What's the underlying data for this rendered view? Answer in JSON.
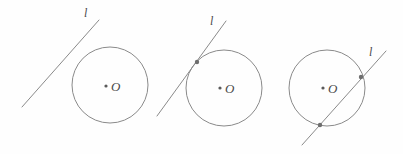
{
  "figure": {
    "width": 403,
    "height": 154,
    "background_color": "#fefefe",
    "stroke_color": "#8a8a8a",
    "dot_color": "#6e6e6e",
    "label_color": "#4a4a4a"
  },
  "panels": [
    {
      "id": "panel-separate",
      "relationship": "separate",
      "line_label": "l",
      "center_label": "O",
      "circle": {
        "cx": 110,
        "cy": 85,
        "r": 38
      },
      "line": {
        "x1": 22,
        "y1": 107,
        "x2": 99,
        "y2": 20
      },
      "line_label_pos": {
        "x": 84,
        "y": 17
      },
      "center_dot": {
        "x": 106,
        "y": 86
      },
      "center_label_pos": {
        "x": 111,
        "y": 91
      },
      "intersections": []
    },
    {
      "id": "panel-tangent",
      "relationship": "tangent",
      "line_label": "l",
      "center_label": "O",
      "circle": {
        "cx": 224,
        "cy": 88,
        "r": 38
      },
      "line": {
        "x1": 157,
        "y1": 116,
        "x2": 226,
        "y2": 21
      },
      "line_label_pos": {
        "x": 210,
        "y": 25
      },
      "center_dot": {
        "x": 220,
        "y": 88
      },
      "center_label_pos": {
        "x": 225,
        "y": 93
      },
      "intersections": [
        {
          "x": 197,
          "y": 62
        }
      ]
    },
    {
      "id": "panel-secant",
      "relationship": "secant",
      "line_label": "l",
      "center_label": "O",
      "circle": {
        "cx": 327,
        "cy": 88,
        "r": 38
      },
      "line": {
        "x1": 302,
        "y1": 145,
        "x2": 386,
        "y2": 51
      },
      "line_label_pos": {
        "x": 369,
        "y": 56
      },
      "center_dot": {
        "x": 323,
        "y": 88
      },
      "center_label_pos": {
        "x": 328,
        "y": 93
      },
      "intersections": [
        {
          "x": 361,
          "y": 77
        },
        {
          "x": 320,
          "y": 125
        }
      ]
    }
  ]
}
